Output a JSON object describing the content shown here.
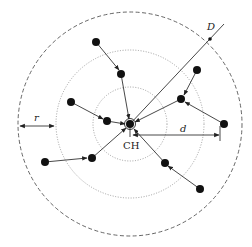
{
  "diagram": {
    "center": {
      "x": 130,
      "y": 124
    },
    "outer_circle": {
      "r": 112,
      "style": "dashed"
    },
    "inner_circles": [
      {
        "r": 74,
        "style": "dotted"
      },
      {
        "r": 37,
        "style": "dotted"
      }
    ],
    "labels": {
      "cluster_head": "CH",
      "ring_width": "r",
      "distance": "d",
      "line_label": "D"
    },
    "nodes": [
      {
        "id": "n1",
        "x": 96,
        "y": 42
      },
      {
        "id": "n2",
        "x": 121,
        "y": 74
      },
      {
        "id": "n3",
        "x": 71,
        "y": 102
      },
      {
        "id": "n4",
        "x": 107,
        "y": 121
      },
      {
        "id": "n5",
        "x": 197,
        "y": 70
      },
      {
        "id": "n6",
        "x": 181,
        "y": 99
      },
      {
        "id": "n7",
        "x": 224,
        "y": 124
      },
      {
        "id": "n8",
        "x": 45,
        "y": 162
      },
      {
        "id": "n9",
        "x": 92,
        "y": 158
      },
      {
        "id": "n10",
        "x": 165,
        "y": 163
      },
      {
        "id": "n11",
        "x": 200,
        "y": 189
      }
    ],
    "edges": [
      {
        "from": "n1",
        "to": "n2"
      },
      {
        "from": "n2",
        "to": "ch"
      },
      {
        "from": "n3",
        "to": "n4"
      },
      {
        "from": "n4",
        "to": "ch"
      },
      {
        "from": "n5",
        "to": "n6"
      },
      {
        "from": "n6",
        "to": "ch"
      },
      {
        "from": "n7",
        "to": "n6"
      },
      {
        "from": "n8",
        "to": "n9"
      },
      {
        "from": "n9",
        "to": "ch"
      },
      {
        "from": "n11",
        "to": "n10"
      },
      {
        "from": "n10",
        "to": "ch"
      }
    ],
    "colors": {
      "stroke": "#333333",
      "node": "#111111",
      "circle": "#555555"
    }
  }
}
